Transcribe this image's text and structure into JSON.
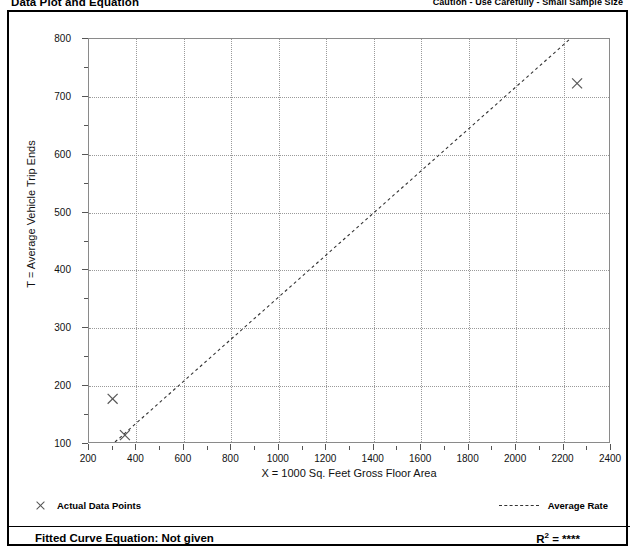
{
  "header": {
    "title": "Data Plot and Equation",
    "caution": "Caution - Use Carefully - Small Sample Size"
  },
  "legend": {
    "data_points_label": "Actual Data Points",
    "average_rate_label": "Average Rate",
    "data_points_marker": "x-marker-icon",
    "average_rate_marker": "dashed-line-icon"
  },
  "footer": {
    "fitted_curve_label": "Fitted Curve Equation:  Not given",
    "r2_symbol": "R",
    "r2_exponent": "2",
    "r2_equals": " = ",
    "r2_value": "****"
  },
  "chart_data": {
    "type": "scatter",
    "title": "Data Plot and Equation",
    "xlabel": "X = 1000 Sq. Feet Gross Floor Area",
    "ylabel": "T = Average Vehicle Trip Ends",
    "xlim": [
      200,
      2400
    ],
    "ylim": [
      100,
      800
    ],
    "xticks": [
      200,
      400,
      600,
      800,
      1000,
      1200,
      1400,
      1600,
      1800,
      2000,
      2200,
      2400
    ],
    "yticks": [
      100,
      200,
      300,
      400,
      500,
      600,
      700,
      800
    ],
    "xtick_minor_step": 100,
    "ytick_minor_step": 50,
    "grid": true,
    "legend_position": "below-axes",
    "series": [
      {
        "name": "Actual Data Points",
        "type": "scatter",
        "marker": "x",
        "color": "#555555",
        "points": [
          {
            "x": 300,
            "y": 175
          },
          {
            "x": 352,
            "y": 112
          },
          {
            "x": 2265,
            "y": 723
          }
        ]
      },
      {
        "name": "Average Rate",
        "type": "line",
        "style": "dashed",
        "color": "#333333",
        "x": [
          310,
          2235
        ],
        "y": [
          100,
          800
        ]
      }
    ]
  },
  "colors": {
    "frame": "#000000",
    "axis": "#8a8a8a",
    "grid": "#9a9a9a",
    "marker": "#555555",
    "trend": "#333333"
  }
}
